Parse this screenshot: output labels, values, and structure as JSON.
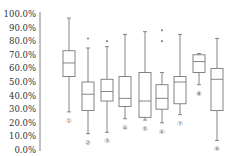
{
  "chart_data": {
    "type": "boxplot",
    "title": "",
    "xlabel": "",
    "ylabel": "",
    "ylim": [
      0,
      100
    ],
    "y_ticks": [
      "0.0%",
      "10.0%",
      "20.0%",
      "30.0%",
      "40.0%",
      "50.0%",
      "60.0%",
      "70.0%",
      "80.0%",
      "90.0%",
      "100.0%"
    ],
    "grid": false,
    "legend": null,
    "categories": [
      "①",
      "②",
      "③",
      "④",
      "⑤",
      "⑥",
      "⑦",
      "⑧",
      "⑨"
    ],
    "boxes": [
      {
        "label": "①",
        "whisker_low": 28,
        "q1": 54,
        "median": 64,
        "q3": 73,
        "whisker_high": 97,
        "outliers": []
      },
      {
        "label": "②",
        "whisker_low": 12,
        "q1": 29,
        "median": 41,
        "q3": 50,
        "whisker_high": 75,
        "outliers": [
          82
        ]
      },
      {
        "label": "③",
        "whisker_low": 13,
        "q1": 36,
        "median": 43,
        "q3": 52,
        "whisker_high": 76,
        "outliers": [
          80
        ]
      },
      {
        "label": "④",
        "whisker_low": 23,
        "q1": 32,
        "median": 38,
        "q3": 54,
        "whisker_high": 85,
        "outliers": []
      },
      {
        "label": "⑤",
        "whisker_low": 22,
        "q1": 24,
        "median": 36,
        "q3": 57,
        "whisker_high": 87,
        "outliers": []
      },
      {
        "label": "⑥",
        "whisker_low": 20,
        "q1": 30,
        "median": 38,
        "q3": 48,
        "whisker_high": 57,
        "outliers": [
          80,
          88
        ]
      },
      {
        "label": "⑦",
        "whisker_low": 26,
        "q1": 34,
        "median": 50,
        "q3": 54,
        "whisker_high": 85,
        "outliers": []
      },
      {
        "label": "⑧",
        "whisker_low": 48,
        "q1": 57,
        "median": 65,
        "q3": 70,
        "whisker_high": 71,
        "outliers": []
      },
      {
        "label": "⑨",
        "whisker_low": 7,
        "q1": 29,
        "median": 52,
        "q3": 60,
        "whisker_high": 82,
        "outliers": []
      }
    ]
  }
}
